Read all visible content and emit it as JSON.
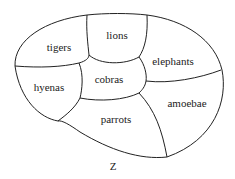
{
  "diagram": {
    "regions": [
      {
        "id": "tigers",
        "label": "tigers",
        "x": 59,
        "y": 47
      },
      {
        "id": "lions",
        "label": "lions",
        "x": 117,
        "y": 35
      },
      {
        "id": "elephants",
        "label": "elephants",
        "x": 173,
        "y": 61
      },
      {
        "id": "hyenas",
        "label": "hyenas",
        "x": 49,
        "y": 87
      },
      {
        "id": "cobras",
        "label": "cobras",
        "x": 109,
        "y": 79
      },
      {
        "id": "amoebae",
        "label": "amoebae",
        "x": 187,
        "y": 103
      },
      {
        "id": "parrots",
        "label": "parrots",
        "x": 116,
        "y": 119
      }
    ],
    "caption": "Z"
  }
}
